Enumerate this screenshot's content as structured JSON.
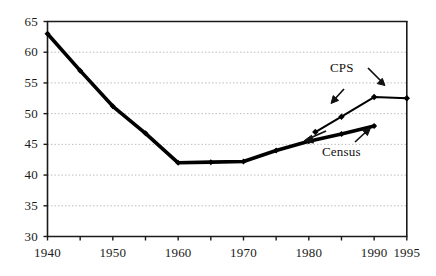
{
  "chart_data": {
    "type": "line",
    "title": "",
    "subtitle": "",
    "xlabel": "",
    "ylabel": "",
    "xlim": [
      1940,
      1995
    ],
    "ylim": [
      30,
      65
    ],
    "grid": true,
    "grid_axis": "y",
    "legend_position": "inline-annotations",
    "y_ticks": [
      30,
      35,
      40,
      45,
      50,
      55,
      60,
      65
    ],
    "y_tick_labels": [
      "30",
      "35",
      "40",
      "45",
      "50",
      "55",
      "60",
      "65"
    ],
    "x_ticks": [
      1940,
      1945,
      1950,
      1955,
      1960,
      1965,
      1970,
      1975,
      1980,
      1985,
      1990,
      1995
    ],
    "x_tick_labels_shown": [
      "1940",
      "1950",
      "1960",
      "1970",
      "1980",
      "1990",
      "1995"
    ],
    "x_labeled_ticks": [
      1940,
      1950,
      1960,
      1970,
      1980,
      1990,
      1995
    ],
    "series": [
      {
        "name": "Census",
        "style": "solid-thick",
        "marker": "diamond",
        "x": [
          1940,
          1945,
          1950,
          1955,
          1960,
          1965,
          1970,
          1975,
          1980,
          1985,
          1990
        ],
        "values": [
          63.0,
          57.0,
          51.2,
          46.8,
          42.0,
          42.1,
          42.2,
          44.0,
          45.5,
          46.7,
          48.0
        ]
      },
      {
        "name": "CPS",
        "style": "solid-thin",
        "marker": "diamond",
        "x": [
          1981,
          1985,
          1990,
          1995
        ],
        "values": [
          47.0,
          49.5,
          52.7,
          52.5
        ]
      }
    ],
    "annotations": [
      {
        "label": "CPS",
        "target_series": "CPS",
        "arrow": "down-right"
      },
      {
        "label": "CPS",
        "target_series": "CPS",
        "arrow": "down-left"
      },
      {
        "label": "Census",
        "target_series": "Census",
        "arrow": "up-right"
      },
      {
        "label": "Census",
        "target_series": "Census",
        "arrow": "left"
      }
    ],
    "colors": {
      "line": "#000000",
      "grid": "#b9b9b9",
      "axis": "#1a1a1a",
      "background": "#ffffff",
      "text": "#1a1a1a"
    }
  },
  "annotations": {
    "cps_label": "CPS",
    "census_label": "Census"
  }
}
